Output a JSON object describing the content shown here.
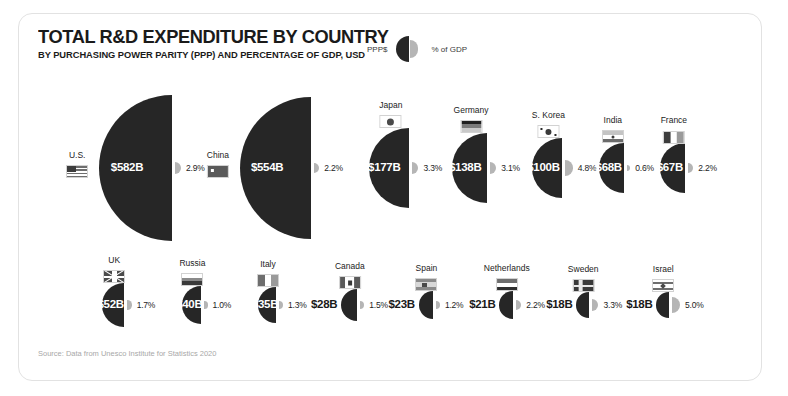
{
  "header": {
    "title": "TOTAL R&D EXPENDITURE BY COUNTRY",
    "subtitle": "BY PURCHASING POWER PARITY (PPP) AND PERCENTAGE OF GDP, USD"
  },
  "legend": {
    "left_label": "PPP$",
    "right_label": "% of GDP"
  },
  "source": "Source: Data from Unesco Institute for Statistics 2020",
  "colors": {
    "ppp_fill": "#262626",
    "gdp_fill": "#b5b5b5",
    "card_border": "#e2e2e2",
    "text": "#1a1a1a",
    "source_text": "#a8a8a8",
    "value_inside": "#ffffff"
  },
  "chart_data": {
    "type": "bar",
    "title": "TOTAL R&D EXPENDITURE BY COUNTRY",
    "subtitle": "BY PURCHASING POWER PARITY (PPP) AND PERCENTAGE OF GDP, USD",
    "xlabel": "",
    "ylabel": "",
    "legend": [
      "PPP$",
      "% of GDP"
    ],
    "legend_position": "top-right",
    "grid": false,
    "note": "Each country is drawn as a pair of area-proportional half-circles: a large dark left half-circle sized by PPP$ expenditure and a small light-gray right half-circle sized by % of GDP.",
    "categories": [
      "U.S.",
      "China",
      "Japan",
      "Germany",
      "S. Korea",
      "India",
      "France",
      "UK",
      "Russia",
      "Italy",
      "Canada",
      "Spain",
      "Netherlands",
      "Sweden",
      "Israel"
    ],
    "series": [
      {
        "name": "PPP$",
        "unit": "billion USD",
        "values": [
          582,
          554,
          177,
          138,
          100,
          68,
          67,
          52,
          40,
          35,
          28,
          23,
          21,
          18,
          18
        ]
      },
      {
        "name": "% of GDP",
        "unit": "percent",
        "values": [
          2.9,
          2.2,
          3.3,
          3.1,
          4.8,
          0.6,
          2.2,
          1.7,
          1.0,
          1.3,
          1.5,
          1.2,
          2.2,
          3.3,
          5.0
        ]
      }
    ],
    "rows": [
      {
        "row": 1,
        "items": [
          {
            "country": "U.S.",
            "flag": "flag-us",
            "amount": "$582B",
            "pct": "2.9%",
            "value": 582,
            "gdp": 2.9
          },
          {
            "country": "China",
            "flag": "flag-cn",
            "amount": "$554B",
            "pct": "2.2%",
            "value": 554,
            "gdp": 2.2
          },
          {
            "country": "Japan",
            "flag": "flag-jp",
            "amount": "$177B",
            "pct": "3.3%",
            "value": 177,
            "gdp": 3.3
          },
          {
            "country": "Germany",
            "flag": "flag-de",
            "amount": "$138B",
            "pct": "3.1%",
            "value": 138,
            "gdp": 3.1
          },
          {
            "country": "S. Korea",
            "flag": "flag-kr",
            "amount": "$100B",
            "pct": "4.8%",
            "value": 100,
            "gdp": 4.8
          },
          {
            "country": "India",
            "flag": "flag-in",
            "amount": "$68B",
            "pct": "0.6%",
            "value": 68,
            "gdp": 0.6
          },
          {
            "country": "France",
            "flag": "flag-fr",
            "amount": "$67B",
            "pct": "2.2%",
            "value": 67,
            "gdp": 2.2
          }
        ]
      },
      {
        "row": 2,
        "items": [
          {
            "country": "UK",
            "flag": "flag-gb",
            "amount": "$52B",
            "pct": "1.7%",
            "value": 52,
            "gdp": 1.7
          },
          {
            "country": "Russia",
            "flag": "flag-ru",
            "amount": "$40B",
            "pct": "1.0%",
            "value": 40,
            "gdp": 1.0
          },
          {
            "country": "Italy",
            "flag": "flag-it",
            "amount": "$35B",
            "pct": "1.3%",
            "value": 35,
            "gdp": 1.3
          },
          {
            "country": "Canada",
            "flag": "flag-ca",
            "amount": "$28B",
            "pct": "1.5%",
            "value": 28,
            "gdp": 1.5
          },
          {
            "country": "Spain",
            "flag": "flag-es",
            "amount": "$23B",
            "pct": "1.2%",
            "value": 23,
            "gdp": 1.2
          },
          {
            "country": "Netherlands",
            "flag": "flag-nl",
            "amount": "$21B",
            "pct": "2.2%",
            "value": 21,
            "gdp": 2.2
          },
          {
            "country": "Sweden",
            "flag": "flag-se",
            "amount": "$18B",
            "pct": "3.3%",
            "value": 18,
            "gdp": 3.3
          },
          {
            "country": "Israel",
            "flag": "flag-il",
            "amount": "$18B",
            "pct": "5.0%",
            "value": 18,
            "gdp": 5.0
          }
        ]
      }
    ]
  }
}
